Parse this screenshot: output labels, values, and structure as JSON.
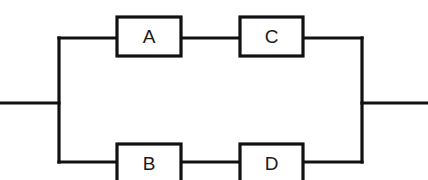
{
  "diagram": {
    "kind": "reliability-block-diagram",
    "canvas": {
      "width": 428,
      "height": 180,
      "background": "#ffffff"
    },
    "style": {
      "line_color": "#111111",
      "line_width": 3.2,
      "block_fill": "#ffffff",
      "label_color": "#1a1a1a",
      "label_size": 19
    },
    "blocks": [
      {
        "id": "A",
        "label": "A",
        "branch": "top",
        "position": "first",
        "x": 117,
        "y": 17,
        "w": 64,
        "h": 39
      },
      {
        "id": "C",
        "label": "C",
        "branch": "top",
        "position": "second",
        "x": 240,
        "y": 17,
        "w": 63,
        "h": 39
      },
      {
        "id": "B",
        "label": "B",
        "branch": "bottom",
        "position": "first",
        "x": 117,
        "y": 144,
        "w": 64,
        "h": 39
      },
      {
        "id": "D",
        "label": "D",
        "branch": "bottom",
        "position": "second",
        "x": 240,
        "y": 144,
        "w": 63,
        "h": 39
      }
    ],
    "nodes": {
      "input_lead_y": 103,
      "output_lead_y": 103,
      "left_bus_x": 59,
      "right_bus_x": 362,
      "top_rail_y": 38,
      "bottom_rail_y": 162,
      "input_lead_start_x": 0,
      "output_lead_end_x": 428
    },
    "wires": [
      {
        "name": "input-lead",
        "points": "0,103 59,103"
      },
      {
        "name": "left-bus",
        "points": "59,38 59,162"
      },
      {
        "name": "top-rail-left",
        "points": "59,38 117,38"
      },
      {
        "name": "link-a-to-c",
        "points": "181,38 240,38"
      },
      {
        "name": "top-rail-right",
        "points": "303,38 362,38"
      },
      {
        "name": "bottom-rail-left",
        "points": "59,162 117,162"
      },
      {
        "name": "link-b-to-d",
        "points": "181,162 240,162"
      },
      {
        "name": "bottom-rail-right",
        "points": "303,162 362,162"
      },
      {
        "name": "right-bus",
        "points": "362,38 362,162"
      },
      {
        "name": "output-lead",
        "points": "362,103 428,103"
      }
    ]
  }
}
